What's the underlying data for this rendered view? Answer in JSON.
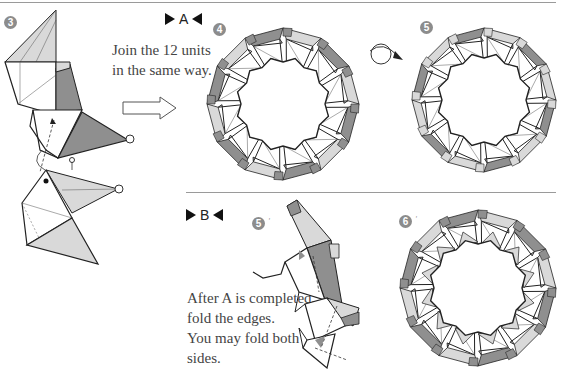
{
  "steps": {
    "step3": "3",
    "step4": "4",
    "step5": "5",
    "step5b": "5",
    "step5b_mark": "′",
    "step6": "6",
    "step6_mark": "′"
  },
  "sections": {
    "a_label": "A",
    "b_label": "B"
  },
  "instructions": {
    "join_line1": "Join the 12 units",
    "join_line2": "in the same way.",
    "after_line1": "After A is completed,",
    "after_line2": "fold the edges.",
    "after_line3": "You may fold both",
    "after_line4": "sides."
  },
  "colors": {
    "dark_gray": "#8f8f8f",
    "light_gray": "#d9d9d9",
    "paper_white": "#ffffff",
    "line": "#222222",
    "badge": "#8c8c8c"
  },
  "ring": {
    "unit_count": 12
  }
}
